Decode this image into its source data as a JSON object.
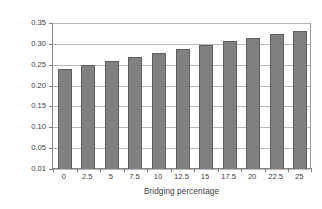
{
  "chart_data": {
    "type": "bar",
    "title": "",
    "subtitle": "",
    "xlabel": "Bridging percentage",
    "ylabel": "U-Value (W/m²K)",
    "categories": [
      "0",
      "2.5",
      "5",
      "7.5",
      "10",
      "12.5",
      "15",
      "17.5",
      "20",
      "22.5",
      "25"
    ],
    "values": [
      0.24,
      0.25,
      0.259,
      0.269,
      0.278,
      0.288,
      0.297,
      0.306,
      0.315,
      0.324,
      0.331
    ],
    "series": [
      {
        "name": "U-Value",
        "values": [
          0.24,
          0.25,
          0.259,
          0.269,
          0.278,
          0.288,
          0.297,
          0.306,
          0.315,
          0.324,
          0.331
        ]
      }
    ],
    "ytick_labels": [
      "0.35",
      "0.30",
      "0.25",
      "0.20",
      "0.15",
      "0.10",
      "0.05",
      "0.01"
    ],
    "ytick_values": [
      0.35,
      0.3,
      0.25,
      0.2,
      0.15,
      0.1,
      0.05,
      0.01
    ],
    "ylim": [
      0.01,
      0.35
    ],
    "grid": "horizontal",
    "legend": "none",
    "annotations": [],
    "colors": {
      "bar_fill": "#808080",
      "bar_outline": "#5e5e5e",
      "gridline": "#b9b9b9",
      "axis": "#8a8a8a",
      "text": "#3b3b3b",
      "background": "#ffffff"
    }
  }
}
